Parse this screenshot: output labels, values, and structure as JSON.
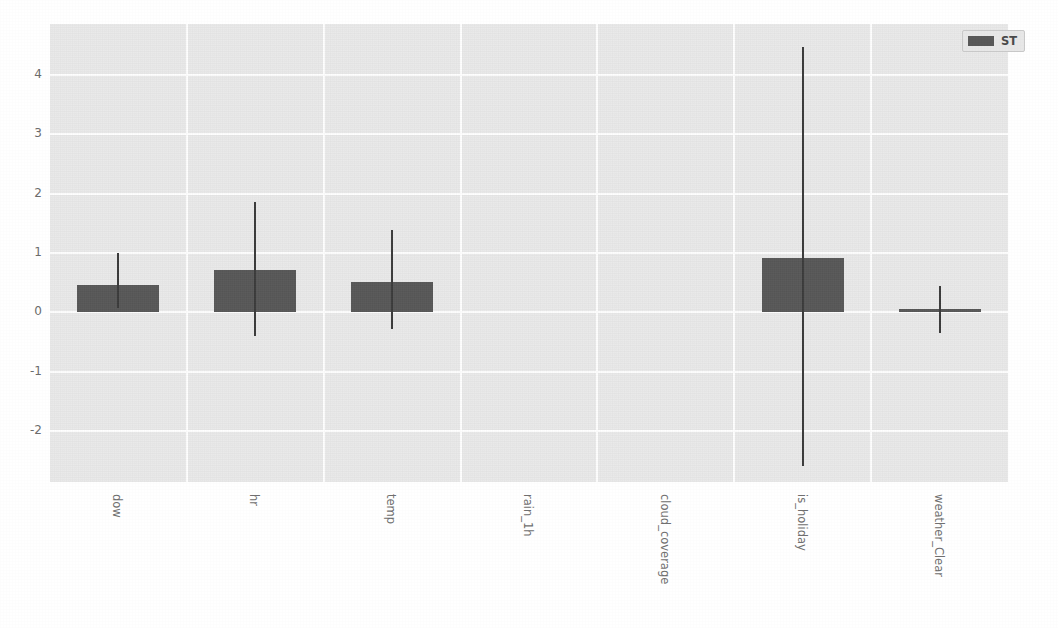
{
  "figure": {
    "title_fragment": "",
    "background_color": "#ffffff",
    "plot_background_color": "#eaeaea",
    "grid_color": "#ffffff",
    "bar_color": "#585858",
    "error_bar_color": "#3b3b3b",
    "tick_label_color": "#6b6b6b"
  },
  "legend": {
    "position": "upper-right",
    "entries": [
      {
        "label": "ST",
        "color": "#585858"
      }
    ]
  },
  "chart_data": {
    "type": "bar",
    "title": "",
    "xlabel": "",
    "ylabel": "",
    "ylim": [
      -2.85,
      4.85
    ],
    "yticks": [
      4,
      3,
      2,
      1,
      0,
      -1,
      -2
    ],
    "ytick_labels": [
      "4",
      "3",
      "2",
      "1",
      "0",
      "-1",
      "-2"
    ],
    "grid": true,
    "orientation": "vertical",
    "error_bars": true,
    "categories": [
      "dow",
      "hr",
      "temp",
      "rain_1h",
      "cloud_coverage",
      "is_holiday",
      "weather_Clear"
    ],
    "series": [
      {
        "name": "ST",
        "color": "#585858",
        "values": [
          0.46,
          0.71,
          0.52,
          0.0,
          0.0,
          0.91,
          0.06
        ],
        "error_low": [
          0.08,
          -0.39,
          -0.28,
          0.0,
          0.0,
          -2.58,
          -0.34
        ],
        "error_high": [
          1.0,
          1.85,
          1.39,
          0.0,
          0.0,
          4.47,
          0.44
        ]
      }
    ]
  }
}
